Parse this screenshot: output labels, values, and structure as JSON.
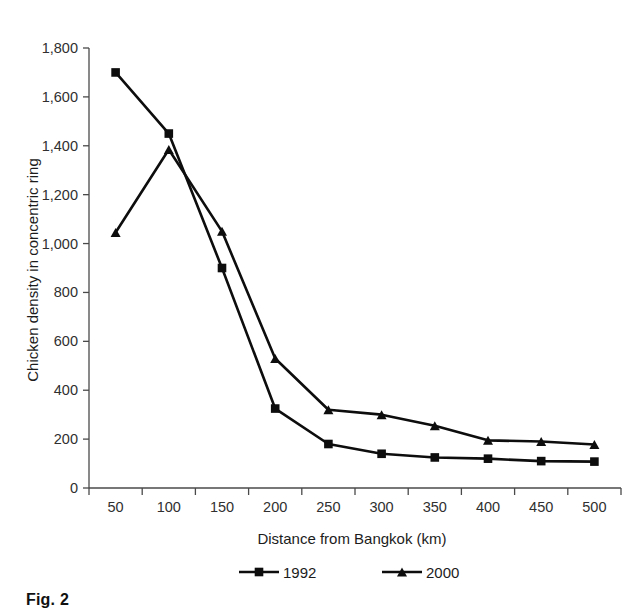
{
  "figure": {
    "caption": "Fig. 2"
  },
  "chart_data": {
    "type": "line",
    "title": "",
    "xlabel": "Distance from Bangkok (km)",
    "ylabel": "Chicken density in concentric ring",
    "categories": [
      "50",
      "100",
      "150",
      "200",
      "250",
      "300",
      "350",
      "400",
      "450",
      "500"
    ],
    "x_tick_labels": [
      "50",
      "100",
      "150",
      "200",
      "250",
      "300",
      "350",
      "400",
      "450",
      "500"
    ],
    "y_tick_labels": [
      "0",
      "200",
      "400",
      "600",
      "800",
      "1,000",
      "1,200",
      "1,400",
      "1,600",
      "1,800"
    ],
    "y_ticks": [
      0,
      200,
      400,
      600,
      800,
      1000,
      1200,
      1400,
      1600,
      1800
    ],
    "ylim": [
      0,
      1800
    ],
    "grid": false,
    "legend_position": "bottom",
    "series": [
      {
        "name": "1992",
        "marker": "square",
        "color": "#0d0d0d",
        "values": [
          1700,
          1450,
          900,
          325,
          180,
          140,
          125,
          120,
          110,
          108
        ]
      },
      {
        "name": "2000",
        "marker": "triangle",
        "color": "#0d0d0d",
        "values": [
          1045,
          1385,
          1050,
          530,
          320,
          300,
          255,
          195,
          190,
          178
        ]
      }
    ]
  }
}
